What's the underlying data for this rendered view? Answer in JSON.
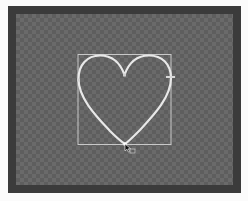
{
  "app": {
    "type": "vector-editor-canvas"
  },
  "canvas": {
    "background": "transparent-checkerboard",
    "frame_color": "#3b3b3b",
    "checker_light": "#6a6a6a",
    "checker_dark": "#5e5e5e"
  },
  "selection": {
    "shape": "heart",
    "stroke_color": "#e6e6e6",
    "bounding_box_color": "#c8c8c8",
    "bounding_box": {
      "x": 78,
      "y": 54,
      "width": 93,
      "height": 91
    },
    "anchors": [
      {
        "name": "top-center-dip",
        "x": 124,
        "y": 75
      },
      {
        "name": "left",
        "x": 78,
        "y": 80
      },
      {
        "name": "right",
        "x": 171,
        "y": 77
      },
      {
        "name": "bottom-tip",
        "x": 125,
        "y": 144
      }
    ]
  },
  "cursor": {
    "icon": "arrow-cursor-icon",
    "x": 125,
    "y": 144
  }
}
